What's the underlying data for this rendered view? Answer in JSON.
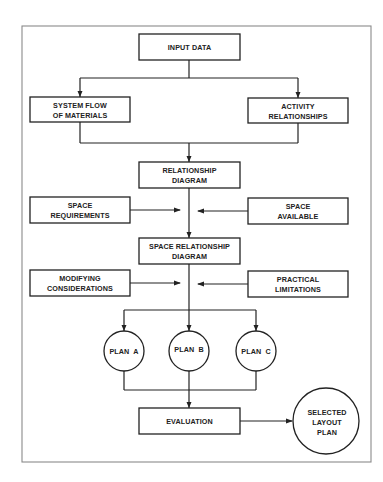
{
  "diagram": {
    "type": "flowchart",
    "nodes": [
      {
        "id": "input",
        "shape": "rect",
        "lines": [
          "INPUT DATA"
        ]
      },
      {
        "id": "flow",
        "shape": "rect",
        "lines": [
          "SYSTEM FLOW",
          "OF MATERIALS"
        ]
      },
      {
        "id": "activity",
        "shape": "rect",
        "lines": [
          "ACTIVITY",
          "RELATIONSHIPS"
        ]
      },
      {
        "id": "reldiag",
        "shape": "rect",
        "lines": [
          "RELATIONSHIP",
          "DIAGRAM"
        ]
      },
      {
        "id": "spacereq",
        "shape": "rect",
        "lines": [
          "SPACE",
          "REQUIREMENTS"
        ]
      },
      {
        "id": "spaceavail",
        "shape": "rect",
        "lines": [
          "SPACE",
          "AVAILABLE"
        ]
      },
      {
        "id": "spacereldiag",
        "shape": "rect",
        "lines": [
          "SPACE RELATIONSHIP",
          "DIAGRAM"
        ]
      },
      {
        "id": "modifying",
        "shape": "rect",
        "lines": [
          "MODIFYING",
          "CONSIDERATIONS"
        ]
      },
      {
        "id": "practical",
        "shape": "rect",
        "lines": [
          "PRACTICAL",
          "LIMITATIONS"
        ]
      },
      {
        "id": "planA",
        "shape": "circle",
        "lines": [
          "PLAN  A"
        ]
      },
      {
        "id": "planB",
        "shape": "circle",
        "lines": [
          "PLAN  B"
        ]
      },
      {
        "id": "planC",
        "shape": "circle",
        "lines": [
          "PLAN  C"
        ]
      },
      {
        "id": "evaluation",
        "shape": "rect",
        "lines": [
          "EVALUATION"
        ]
      },
      {
        "id": "selected",
        "shape": "circle",
        "lines": [
          "SELECTED",
          "LAYOUT",
          "PLAN"
        ]
      }
    ],
    "edges": [
      {
        "from": "input",
        "to": "flow"
      },
      {
        "from": "input",
        "to": "activity"
      },
      {
        "from": "flow",
        "to": "reldiag"
      },
      {
        "from": "activity",
        "to": "reldiag"
      },
      {
        "from": "reldiag",
        "to": "spacereldiag"
      },
      {
        "from": "spacereq",
        "to": "spacereldiag"
      },
      {
        "from": "spaceavail",
        "to": "spacereldiag"
      },
      {
        "from": "spacereldiag",
        "to": "planA"
      },
      {
        "from": "spacereldiag",
        "to": "planB"
      },
      {
        "from": "spacereldiag",
        "to": "planC"
      },
      {
        "from": "modifying",
        "to": "planB"
      },
      {
        "from": "practical",
        "to": "planB"
      },
      {
        "from": "planA",
        "to": "evaluation"
      },
      {
        "from": "planB",
        "to": "evaluation"
      },
      {
        "from": "planC",
        "to": "evaluation"
      },
      {
        "from": "evaluation",
        "to": "selected"
      }
    ]
  }
}
